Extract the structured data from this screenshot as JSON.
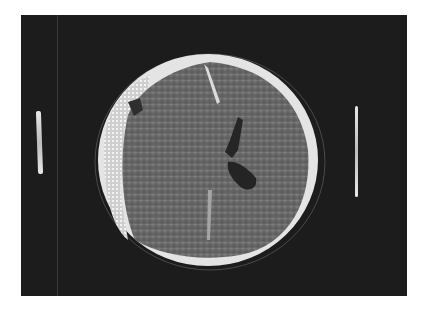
{
  "image": {
    "subject": "axial CT scan of head",
    "description": "Axial CT slice of the skull showing a bright skull rim, a left-side extra-axial collection with a dark air pocket, a midline fissure, and a dark dilated ventricle. Two vertical calibration markers flank the skull.",
    "colors": {
      "page_background": "#ffffff",
      "film_background": "#1c1c1c",
      "bone": "#e6e6e6",
      "brain": "#6e6e6e",
      "ventricle": "#262626"
    }
  }
}
